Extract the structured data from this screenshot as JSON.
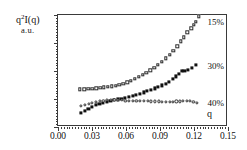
{
  "chart_data": {
    "type": "scatter",
    "title": "",
    "ylabel": "q2I(q)",
    "ylabel_units": "a.u.",
    "ylabel_main": "q",
    "ylabel_exp": "2",
    "ylabel_rest": "I(q)",
    "xlabel": "q",
    "xlim": [
      0.0,
      0.15
    ],
    "ylim": [
      0.0,
      0.002
    ],
    "xticks": [
      0.0,
      0.03,
      0.06,
      0.09,
      0.12,
      0.15
    ],
    "xticklabels": [
      "0.00",
      "0.03",
      "0.06",
      "0.09",
      "0.12",
      "0.15"
    ],
    "yticks": [
      0.0,
      0.0005,
      0.001,
      0.0015,
      0.002
    ],
    "yticklabels": [
      "0.0E+0",
      "5.0E-4",
      "1.0E-3",
      "1.5E-3",
      "2.0E-3"
    ],
    "grid": false,
    "legend_position": "inline-right",
    "series": [
      {
        "name": "15%",
        "label": "15%",
        "marker": "open-square",
        "color": "#2b2b2b",
        "points": [
          [
            0.0195,
            0.000672
          ],
          [
            0.0232,
            0.000676
          ],
          [
            0.0268,
            0.000679
          ],
          [
            0.0303,
            0.000686
          ],
          [
            0.0338,
            0.000691
          ],
          [
            0.0372,
            0.000697
          ],
          [
            0.0406,
            0.000706
          ],
          [
            0.044,
            0.000716
          ],
          [
            0.0474,
            0.000727
          ],
          [
            0.0508,
            0.000741
          ],
          [
            0.0542,
            0.000757
          ],
          [
            0.0576,
            0.000776
          ],
          [
            0.061,
            0.0008
          ],
          [
            0.0644,
            0.000828
          ],
          [
            0.0678,
            0.000859
          ],
          [
            0.0712,
            0.000893
          ],
          [
            0.0746,
            0.00093
          ],
          [
            0.078,
            0.00097
          ],
          [
            0.0814,
            0.001013
          ],
          [
            0.0848,
            0.001062
          ],
          [
            0.0882,
            0.001113
          ],
          [
            0.0916,
            0.001168
          ],
          [
            0.095,
            0.001225
          ],
          [
            0.0984,
            0.00129
          ],
          [
            0.1018,
            0.00136
          ],
          [
            0.1052,
            0.00144
          ],
          [
            0.1086,
            0.00153
          ],
          [
            0.1108,
            0.0016
          ],
          [
            0.1142,
            0.00169
          ],
          [
            0.1176,
            0.001765
          ],
          [
            0.1198,
            0.001825
          ],
          [
            0.1218,
            0.00188
          ],
          [
            0.124,
            0.001975
          ]
        ]
      },
      {
        "name": "30%",
        "label": "30%",
        "marker": "filled-square",
        "color": "#111111",
        "points": [
          [
            0.02,
            0.00025
          ],
          [
            0.0235,
            0.00029
          ],
          [
            0.0268,
            0.000325
          ],
          [
            0.03,
            0.000355
          ],
          [
            0.0332,
            0.000388
          ],
          [
            0.0365,
            0.000412
          ],
          [
            0.0398,
            0.000432
          ],
          [
            0.043,
            0.000452
          ],
          [
            0.0462,
            0.000468
          ],
          [
            0.0495,
            0.00048
          ],
          [
            0.0528,
            0.000492
          ],
          [
            0.056,
            0.000508
          ],
          [
            0.0592,
            0.000522
          ],
          [
            0.0625,
            0.000538
          ],
          [
            0.0658,
            0.000556
          ],
          [
            0.069,
            0.000575
          ],
          [
            0.0722,
            0.000596
          ],
          [
            0.0755,
            0.000618
          ],
          [
            0.0788,
            0.00064
          ],
          [
            0.082,
            0.000662
          ],
          [
            0.0852,
            0.000688
          ],
          [
            0.0885,
            0.000712
          ],
          [
            0.0918,
            0.000742
          ],
          [
            0.095,
            0.000775
          ],
          [
            0.0982,
            0.000812
          ],
          [
            0.1012,
            0.000855
          ],
          [
            0.1042,
            0.000905
          ],
          [
            0.1068,
            0.00095
          ],
          [
            0.1092,
            0.000995
          ],
          [
            0.1115,
            0.001
          ],
          [
            0.1148,
            0.00102
          ],
          [
            0.1182,
            0.00106
          ],
          [
            0.1218,
            0.001105
          ]
        ]
      },
      {
        "name": "40%",
        "label": "40%",
        "marker": "open-circle",
        "color": "#2b2b2b",
        "points": [
          [
            0.0205,
            0.00038
          ],
          [
            0.0238,
            0.000395
          ],
          [
            0.027,
            0.000412
          ],
          [
            0.0302,
            0.000432
          ],
          [
            0.0335,
            0.000448
          ],
          [
            0.0368,
            0.00046
          ],
          [
            0.04,
            0.00047
          ],
          [
            0.0432,
            0.000478
          ],
          [
            0.0465,
            0.000484
          ],
          [
            0.0498,
            0.000488
          ],
          [
            0.053,
            0.00049
          ],
          [
            0.0562,
            0.00048
          ],
          [
            0.0595,
            0.00047
          ],
          [
            0.0628,
            0.000468
          ],
          [
            0.066,
            0.000466
          ],
          [
            0.0692,
            0.000464
          ],
          [
            0.0725,
            0.000462
          ],
          [
            0.0758,
            0.000462
          ],
          [
            0.079,
            0.00046
          ],
          [
            0.0822,
            0.000458
          ],
          [
            0.0855,
            0.000458
          ],
          [
            0.0888,
            0.000456
          ],
          [
            0.092,
            0.000452
          ],
          [
            0.0952,
            0.00045
          ],
          [
            0.0985,
            0.00045
          ],
          [
            0.1015,
            0.000452
          ],
          [
            0.1045,
            0.000456
          ],
          [
            0.1075,
            0.000458
          ],
          [
            0.1105,
            0.000462
          ],
          [
            0.1135,
            0.000466
          ],
          [
            0.1165,
            0.000462
          ],
          [
            0.1195,
            0.00045
          ],
          [
            0.1225,
            0.00043
          ]
        ]
      }
    ],
    "annotations": [
      {
        "text": "15%",
        "x": 0.132,
        "y": 0.00188
      },
      {
        "text": "30%",
        "x": 0.132,
        "y": 0.00109
      },
      {
        "text": "40%",
        "x": 0.132,
        "y": 0.000432
      }
    ]
  }
}
